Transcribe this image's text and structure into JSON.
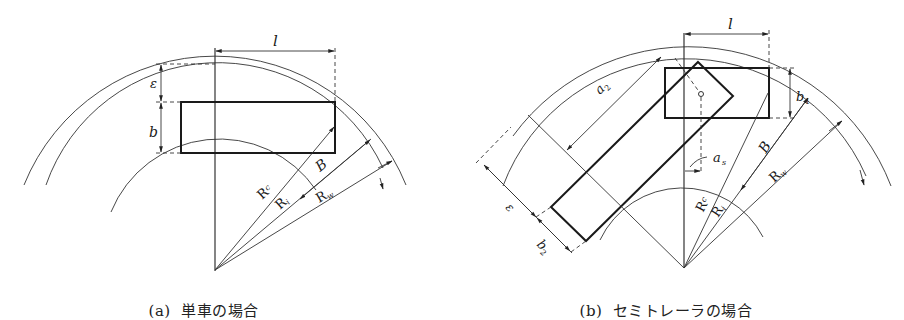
{
  "figure": {
    "panels": [
      {
        "id": "a",
        "caption_prefix": "(a)",
        "caption_text": "単車の場合",
        "labels": {
          "length": "l",
          "offset": "ε",
          "width": "b",
          "track_width": "B",
          "radius_c": "R",
          "radius_c_sub": "c",
          "radius_i": "R",
          "radius_i_sub": "i",
          "radius_w": "R",
          "radius_w_sub": "w"
        }
      },
      {
        "id": "b",
        "caption_prefix": "(b)",
        "caption_text": "セミトレーラの場合",
        "labels": {
          "length": "l",
          "offset": "ε",
          "tractor_width": "b",
          "tractor_width_sub": "1",
          "trailer_width": "b",
          "trailer_width_sub": "2",
          "trailer_length": "a",
          "trailer_length_sub": "2",
          "kingpin_offset": "a",
          "kingpin_offset_sub": "s",
          "track_width": "B",
          "radius_c": "R",
          "radius_c_sub": "c",
          "radius_i": "R",
          "radius_i_sub": "i",
          "radius_w": "R",
          "radius_w_sub": "w"
        }
      }
    ],
    "colors": {
      "line": "#1a1a1a",
      "background": "#ffffff"
    }
  }
}
